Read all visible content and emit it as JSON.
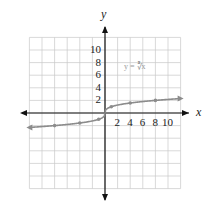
{
  "chart_data": {
    "type": "line",
    "title": "",
    "function_label": "y = ∛x",
    "xlabel": "x",
    "ylabel": "y",
    "xlim": [
      -12,
      12
    ],
    "ylim": [
      -12,
      12
    ],
    "grid": true,
    "x_tick_labels": [
      "2",
      "4",
      "6",
      "8",
      "10"
    ],
    "y_tick_labels": [
      "2",
      "4",
      "6",
      "8",
      "10"
    ],
    "series": [
      {
        "name": "y = ∛x",
        "color": "#8c8c8c",
        "points": [
          {
            "x": -8,
            "y": -2
          },
          {
            "x": -4,
            "y": -1.59
          },
          {
            "x": -1,
            "y": -1
          },
          {
            "x": 0,
            "y": 0
          },
          {
            "x": 1,
            "y": 1
          },
          {
            "x": 4,
            "y": 1.59
          },
          {
            "x": 8,
            "y": 2
          }
        ]
      }
    ]
  },
  "labels": {
    "x_axis": "x",
    "y_axis": "y",
    "function": "y = ∛x",
    "xt": [
      "2",
      "4",
      "6",
      "8",
      "10"
    ],
    "yt": [
      "2",
      "4",
      "6",
      "8",
      "10"
    ]
  }
}
